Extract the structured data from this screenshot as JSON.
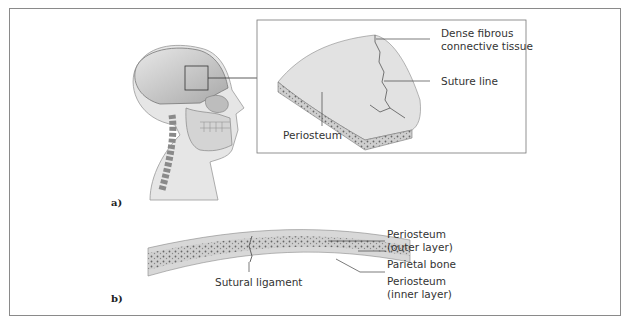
{
  "figure": {
    "panel_a": {
      "label": "a)",
      "callouts": {
        "dense_fibrous_1": "Dense fibrous",
        "dense_fibrous_2": "connective tissue",
        "suture_line": "Suture line",
        "periosteum": "Periosteum"
      }
    },
    "panel_b": {
      "label": "b)",
      "callouts": {
        "periosteum_outer_1": "Periosteum",
        "periosteum_outer_2": "(outer layer)",
        "parietal_bone": "Parietal bone",
        "periosteum_inner_1": "Periosteum",
        "periosteum_inner_2": "(inner layer)",
        "sutural_ligament": "Sutural ligament"
      }
    },
    "colors": {
      "frame": "#8a8a8a",
      "bone": "#d9d9d9",
      "bone_dark": "#9a9a9a",
      "leader": "#555555"
    }
  }
}
